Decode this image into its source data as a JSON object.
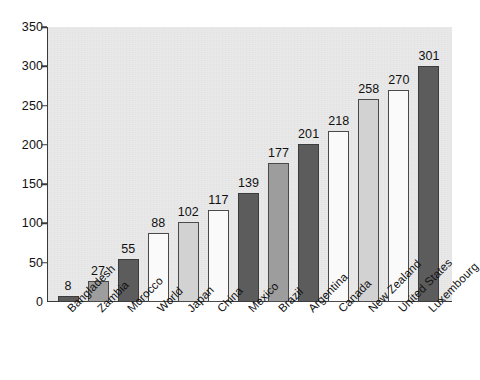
{
  "chart_data": {
    "type": "bar",
    "title": "",
    "subtitle": "",
    "xlabel": "",
    "ylabel": "",
    "ylim": [
      0,
      350
    ],
    "ytick_labels": [
      "0",
      "50",
      "100",
      "150",
      "200",
      "250",
      "300",
      "350"
    ],
    "yticks": [
      0,
      50,
      100,
      150,
      200,
      250,
      300,
      350
    ],
    "grid": false,
    "legend": "none",
    "categories": [
      "Bangladesh",
      "Zambia",
      "Morocco",
      "World",
      "Japan",
      "China",
      "Mexico",
      "Brazil",
      "Argentina",
      "Canada",
      "New Zealand",
      "United States",
      "Luxembourg"
    ],
    "values": [
      8,
      27,
      55,
      88,
      102,
      117,
      139,
      177,
      201,
      218,
      258,
      270,
      301
    ],
    "value_labels": [
      "8",
      "27",
      "55",
      "88",
      "102",
      "117",
      "139",
      "177",
      "201",
      "218",
      "258",
      "270",
      "301"
    ],
    "bar_fills": [
      "dark",
      "medium",
      "dark",
      "white",
      "light",
      "white",
      "dark",
      "medium",
      "dark",
      "white",
      "light",
      "white",
      "dark"
    ],
    "colors": {
      "dark": "#5c5c5c",
      "medium": "#9d9d9d",
      "light": "#d2d2d2",
      "white": "#fafafa",
      "plot_background": "#e9e9e9",
      "axis": "#3a3a3a",
      "text": "#111111"
    }
  }
}
